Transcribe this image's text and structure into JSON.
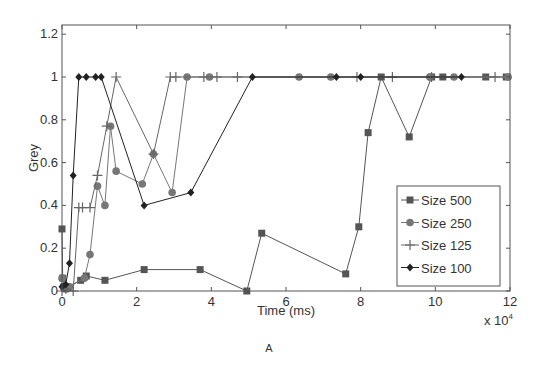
{
  "figure": {
    "caption": "A",
    "x_multiplier_label": "x 10",
    "x_multiplier_exponent": "4"
  },
  "chart_data": {
    "type": "line",
    "title": "",
    "xlabel": "Time (ms)",
    "ylabel": "Grey",
    "x_scale_note": "x 10^4",
    "xlim": [
      0,
      12
    ],
    "ylim": [
      0,
      1.25
    ],
    "xticks": [
      0,
      2,
      4,
      6,
      8,
      10,
      12
    ],
    "xtick_labels": [
      "0",
      "2",
      "4",
      "6",
      "8",
      "10",
      "12"
    ],
    "yticks": [
      0,
      0.2,
      0.4,
      0.6,
      0.8,
      1.0,
      1.2
    ],
    "ytick_labels": [
      "0",
      "0.2",
      "0.4",
      "0.6",
      "0.8",
      "1",
      "1.2"
    ],
    "grid": false,
    "legend_position": "lower right",
    "series": [
      {
        "name": "Size 500",
        "marker": "square",
        "color": "#555555",
        "x": [
          0.0,
          0.02,
          0.05,
          0.1,
          0.15,
          0.5,
          0.65,
          1.15,
          2.2,
          3.7,
          4.95,
          5.35,
          7.6,
          7.95,
          8.2,
          8.55,
          9.3,
          9.9,
          10.2,
          11.35,
          11.9
        ],
        "y": [
          0.29,
          0.06,
          0.02,
          0.01,
          0.02,
          0.05,
          0.07,
          0.05,
          0.1,
          0.1,
          0.0,
          0.27,
          0.08,
          0.3,
          0.74,
          1.0,
          0.72,
          1.0,
          1.0,
          1.0,
          1.0
        ]
      },
      {
        "name": "Size 250",
        "marker": "circle",
        "color": "#777777",
        "x": [
          0.0,
          0.05,
          0.1,
          0.2,
          0.6,
          0.75,
          0.95,
          1.15,
          1.3,
          1.45,
          2.15,
          2.45,
          2.95,
          3.35,
          3.95,
          6.35,
          7.2,
          9.85,
          10.5,
          11.95
        ],
        "y": [
          0.06,
          0.02,
          0.01,
          0.02,
          0.06,
          0.17,
          0.49,
          0.4,
          0.77,
          0.56,
          0.5,
          0.64,
          0.46,
          1.0,
          1.0,
          1.0,
          1.0,
          1.0,
          1.0,
          1.0
        ]
      },
      {
        "name": "Size 125",
        "marker": "plus",
        "color": "#666666",
        "x": [
          0.0,
          0.1,
          0.3,
          0.45,
          0.55,
          0.75,
          0.95,
          1.2,
          1.45,
          2.45,
          2.9,
          3.05,
          3.8,
          4.15,
          4.7,
          7.9,
          8.85,
          9.9,
          11.6
        ],
        "y": [
          0.0,
          0.01,
          0.0,
          0.39,
          0.39,
          0.39,
          0.54,
          0.77,
          1.0,
          0.64,
          1.0,
          1.0,
          1.0,
          1.0,
          1.0,
          1.0,
          1.0,
          1.0,
          1.0
        ]
      },
      {
        "name": "Size 100",
        "marker": "diamond",
        "color": "#222222",
        "x": [
          0.0,
          0.1,
          0.2,
          0.3,
          0.45,
          0.65,
          0.9,
          1.05,
          2.2,
          3.45,
          5.1,
          7.35,
          8.0,
          10.7
        ],
        "y": [
          0.02,
          0.03,
          0.13,
          0.54,
          1.0,
          1.0,
          1.0,
          1.0,
          0.4,
          0.46,
          1.0,
          1.0,
          1.0,
          1.0
        ]
      }
    ]
  }
}
